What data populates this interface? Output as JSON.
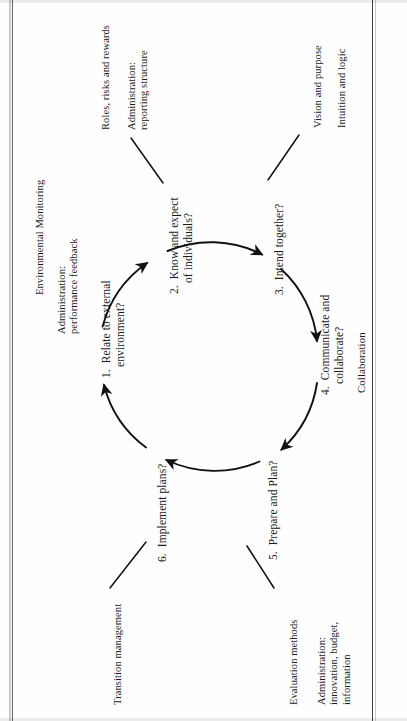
{
  "figure": {
    "type": "circular-process-diagram",
    "orientation": "rotated-90-ccw",
    "stages": [
      {
        "id": "stage-1",
        "number": "1.",
        "line1": "Relate to external",
        "line2": "environment?",
        "angle_deg": 180
      },
      {
        "id": "stage-2",
        "number": "2.",
        "line1": "Know and expect",
        "line2": "of individuals?",
        "angle_deg": 240
      },
      {
        "id": "stage-3",
        "number": "3.",
        "line1": "Intend together?",
        "line2": "",
        "angle_deg": 300
      },
      {
        "id": "stage-4",
        "number": "4.",
        "line1": "Communicate and",
        "line2": "collaborate?",
        "angle_deg": 0
      },
      {
        "id": "stage-5",
        "number": "5.",
        "line1": "Prepare and Plan?",
        "line2": "",
        "angle_deg": 60
      },
      {
        "id": "stage-6",
        "number": "6.",
        "line1": "Implement plans?",
        "line2": "",
        "angle_deg": 120
      }
    ],
    "annotations": [
      {
        "id": "annotation-environmental-monitoring",
        "line1": "Environmental Monitoring",
        "line2": "",
        "line3": ""
      },
      {
        "id": "annotation-administration-performance",
        "line1": "Administration:",
        "line2": "performance feedback",
        "line3": ""
      },
      {
        "id": "annotation-roles-risks-rewards",
        "line1": "Roles, risks and rewards",
        "line2": "",
        "line3": ""
      },
      {
        "id": "annotation-administration-reporting",
        "line1": "Administration:",
        "line2": "reporting structure",
        "line3": ""
      },
      {
        "id": "annotation-vision-purpose",
        "line1": "Vision and purpose",
        "line2": "",
        "line3": ""
      },
      {
        "id": "annotation-intuition-logic",
        "line1": "Intuition and logic",
        "line2": "",
        "line3": ""
      },
      {
        "id": "annotation-collaboration",
        "line1": "Collaboration",
        "line2": "",
        "line3": ""
      },
      {
        "id": "annotation-evaluation-methods",
        "line1": "Evaluation methods",
        "line2": "",
        "line3": ""
      },
      {
        "id": "annotation-administration-innovation",
        "line1": "Administration:",
        "line2": "innovation, budget,",
        "line3": "information"
      },
      {
        "id": "annotation-transition-management",
        "line1": "Transition management",
        "line2": "",
        "line3": ""
      }
    ],
    "colors": {
      "ink": "#1b1b1b",
      "stroke": "#111111",
      "paper": "#fefefe",
      "edge_rule": "#4a4a4a"
    }
  }
}
